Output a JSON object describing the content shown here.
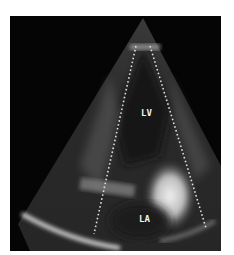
{
  "image": {
    "type": "echocardiogram",
    "view": "apical two-chamber ultrasound sector",
    "labels": {
      "lv": "LV",
      "la": "LA"
    },
    "colors": {
      "background": "#ffffff",
      "frame": "#050505",
      "tissue_bright": "#e8e8e8",
      "tissue_mid": "#6a6a6a",
      "dotted_lines": "#dcdcdc"
    }
  }
}
